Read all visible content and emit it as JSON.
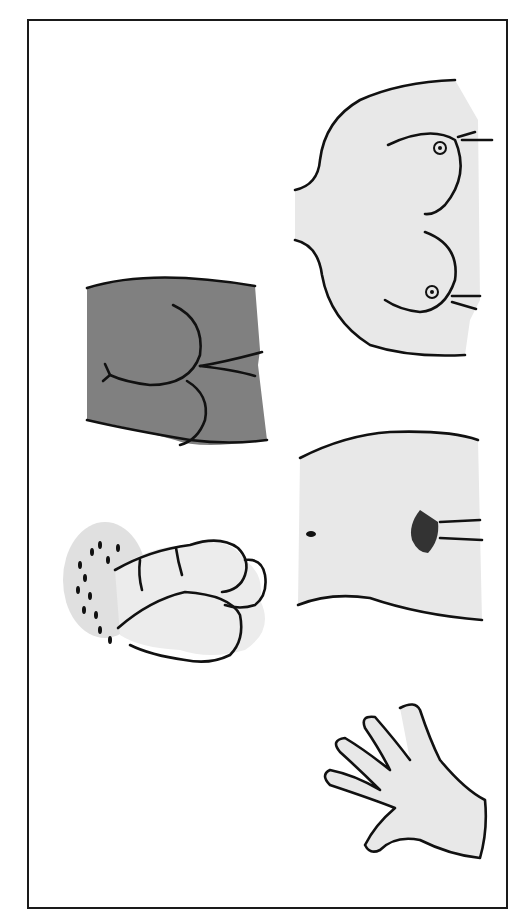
{
  "diagram": {
    "type": "anatomical-illustration",
    "orientation": "rotated-90",
    "panels": [
      {
        "id": "torso-upper",
        "description": "upper torso outline (front view)",
        "fill": "#e8e8e8"
      },
      {
        "id": "buttocks",
        "description": "lower back / buttocks outline (rear view)",
        "fill": "#808080"
      },
      {
        "id": "pelvis-front",
        "description": "lower abdomen / pelvis outline (front view)",
        "fill": "#e8e8e8"
      },
      {
        "id": "genital-male",
        "description": "male external anatomy outline",
        "fill": "#e8e8e8"
      },
      {
        "id": "hand",
        "description": "hand outline",
        "fill": "#e8e8e8"
      }
    ],
    "colors": {
      "frame": "#1a1a1a",
      "outline": "#111111",
      "light_fill": "#e8e8e8",
      "dark_fill": "#808080",
      "background": "#ffffff"
    }
  }
}
